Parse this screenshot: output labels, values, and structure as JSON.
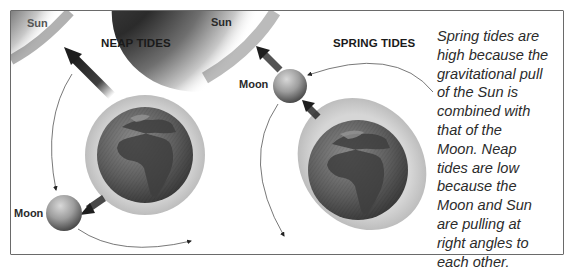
{
  "diagram": {
    "panels": [
      {
        "id": "neap",
        "title": "NEAP TIDES",
        "sun_label": "Sun",
        "moon_label": "Moon"
      },
      {
        "id": "spring",
        "title": "SPRING TIDES",
        "sun_label": "Sun",
        "moon_label": "Moon"
      }
    ],
    "caption_lines": [
      "Spring tides are",
      "high because the",
      "gravitational pull",
      "of the Sun is",
      "combined with",
      "that of the",
      "Moon. Neap",
      "tides are low",
      "because the",
      "Moon and Sun",
      "are pulling at",
      "right angles to",
      "each other."
    ],
    "colors": {
      "border": "#6a6a6a",
      "sun_dark": "#2e2e2e",
      "earth": "#5a5a5a",
      "tidal_bulge": "#c9c9c9",
      "moon": "#9a9a9a",
      "arrow": "#2a2a2a",
      "text": "#1a1a1a"
    }
  }
}
